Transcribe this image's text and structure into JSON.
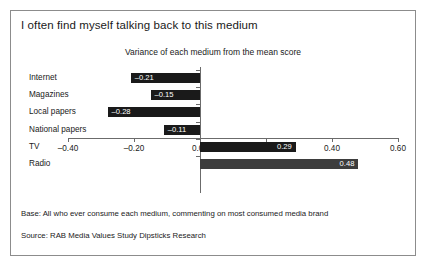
{
  "slide": {
    "title": "I often find myself talking back to this medium",
    "notes": {
      "base": "Base: All who ever consume each medium, commenting on most consumed media brand",
      "source": "Source: RAB Media Values Study Dipsticks Research"
    }
  },
  "colors": {
    "bar_dark": "#1a1a1a",
    "bar_gray": "#3d3d3d",
    "axis": "#6b6b6b",
    "border": "#8c8c8c",
    "text": "#1a1a1a",
    "value_text": "#ffffff"
  },
  "chart_data": {
    "type": "bar",
    "orientation": "horizontal",
    "title": "Variance of each medium from the mean score",
    "xlabel": "",
    "ylabel": "",
    "xlim": [
      -0.4,
      0.6
    ],
    "grid": false,
    "legend": false,
    "xticks": [
      "-0.40",
      "-0.20",
      "0.00",
      "0.20",
      "0.40",
      "0.60"
    ],
    "xtick_values": [
      -0.4,
      -0.2,
      0.0,
      0.2,
      0.4,
      0.6
    ],
    "categories": [
      "Internet",
      "Magazines",
      "Local papers",
      "National papers",
      "TV",
      "Radio"
    ],
    "values": [
      -0.21,
      -0.15,
      -0.28,
      -0.11,
      0.29,
      0.48
    ],
    "value_labels": [
      "–0.21",
      "–0.15",
      "–0.28",
      "–0.11",
      "0.29",
      "0.48"
    ],
    "bar_colors": [
      "#1a1a1a",
      "#1a1a1a",
      "#1a1a1a",
      "#1a1a1a",
      "#1a1a1a",
      "#3d3d3d"
    ]
  }
}
